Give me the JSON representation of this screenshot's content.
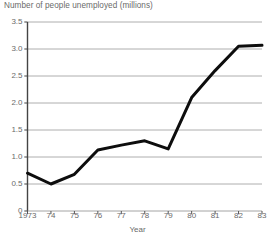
{
  "chart_data": {
    "type": "line",
    "title": "Number of people unemployed (millions)",
    "xlabel": "Year",
    "ylabel": "",
    "x": [
      1973,
      1974,
      1975,
      1976,
      1977,
      1978,
      1979,
      1980,
      1981,
      1982,
      1983
    ],
    "xtick_labels": [
      "1973",
      "74",
      "75",
      "76",
      "77",
      "78",
      "79",
      "80",
      "81",
      "82",
      "83"
    ],
    "values": [
      0.7,
      0.5,
      0.68,
      1.13,
      1.22,
      1.3,
      1.15,
      2.1,
      2.6,
      3.05,
      3.07
    ],
    "ytick_labels": [
      "3.5",
      "3.0",
      "2.5",
      "2.0",
      "1.5",
      "1.0",
      "0.5",
      "0"
    ],
    "ytick_values": [
      3.5,
      3.0,
      2.5,
      2.0,
      1.5,
      1.0,
      0.5,
      0
    ],
    "ylim": [
      0,
      3.5
    ],
    "xlim": [
      1973,
      1983
    ],
    "grid": true,
    "legend": false,
    "series_name": "Number of people unemployed (millions)",
    "line_color": "#0d0d0d",
    "grid_color": "#9a9a9a",
    "axis_color": "#444444",
    "text_color": "#6a6a6a",
    "background_color": "#ffffff"
  }
}
